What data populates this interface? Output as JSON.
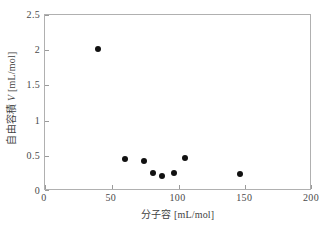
{
  "chart_data": {
    "type": "scatter",
    "title": "",
    "xlabel": "分子容 [mL/mol]",
    "ylabel": "自由容積 V [mL/mol]",
    "xlim": [
      0,
      200
    ],
    "ylim": [
      0,
      2.5
    ],
    "xticks": [
      "0",
      "50",
      "100",
      "150",
      "200"
    ],
    "xtick_values": [
      0,
      50,
      100,
      150,
      200
    ],
    "yticks": [
      "0",
      "0.5",
      "1",
      "1.5",
      "2",
      "2.5"
    ],
    "ytick_values": [
      0,
      0.5,
      1,
      1.5,
      2,
      2.5
    ],
    "grid": false,
    "legend": null,
    "marker_color": "#111111",
    "frame_color": "#b0b0b0",
    "series": [
      {
        "name": "自由容積",
        "points": [
          {
            "x": 40,
            "y": 2.01
          },
          {
            "x": 60,
            "y": 0.45
          },
          {
            "x": 74,
            "y": 0.43
          },
          {
            "x": 81,
            "y": 0.26
          },
          {
            "x": 88,
            "y": 0.22
          },
          {
            "x": 97,
            "y": 0.25
          },
          {
            "x": 105,
            "y": 0.47
          },
          {
            "x": 146,
            "y": 0.24
          }
        ]
      }
    ]
  },
  "axis": {
    "x_title": "分子容 [mL/mol]",
    "y_title_prefix": "自由容積 ",
    "y_title_var": "V",
    "y_title_suffix": " [mL/mol]"
  }
}
